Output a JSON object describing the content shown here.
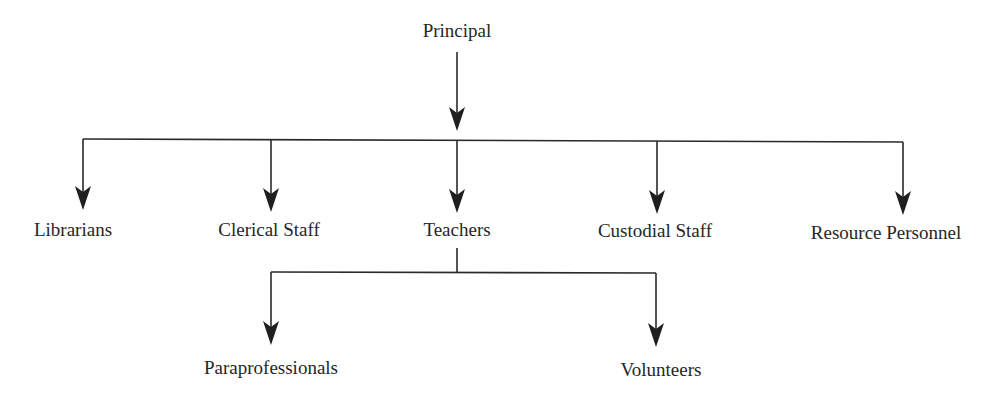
{
  "diagram": {
    "type": "org-chart",
    "line_color": "#2a2a2a",
    "text_color": "#262626",
    "root": {
      "id": "principal",
      "label": "Principal",
      "x": 457,
      "y": 22
    },
    "level1": [
      {
        "id": "librarians",
        "label": "Librarians",
        "x": 73,
        "y": 219
      },
      {
        "id": "clerical-staff",
        "label": "Clerical Staff",
        "x": 269,
        "y": 219
      },
      {
        "id": "teachers",
        "label": "Teachers",
        "x": 457,
        "y": 219
      },
      {
        "id": "custodial-staff",
        "label": "Custodial Staff",
        "x": 654,
        "y": 220
      },
      {
        "id": "resource-personnel",
        "label": "Resource Personnel",
        "x": 886,
        "y": 222
      }
    ],
    "level2": [
      {
        "id": "paraprofessionals",
        "label": "Paraprofessionals",
        "parent": "teachers",
        "x": 271,
        "y": 357
      },
      {
        "id": "volunteers",
        "label": "Volunteers",
        "parent": "teachers",
        "x": 661,
        "y": 359
      }
    ]
  }
}
